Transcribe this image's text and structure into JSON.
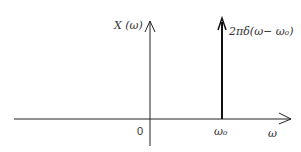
{
  "diagram": {
    "type": "frequency-spectrum-impulse",
    "y_axis_label": "X (ω)",
    "x_axis_label": "ω",
    "origin_label": "0",
    "impulse_position_label": "ω₀",
    "impulse_label": "2πδ(ω− ω₀)",
    "colors": {
      "line": "#222222",
      "text": "#333333",
      "background": "#ffffff"
    }
  }
}
